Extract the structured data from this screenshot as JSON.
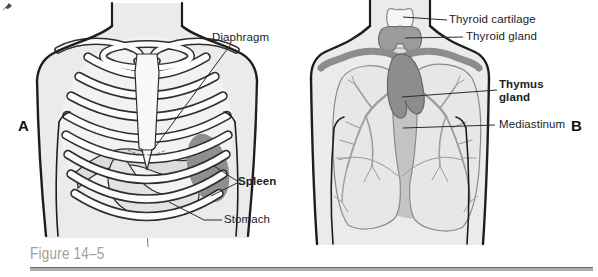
{
  "figure": {
    "caption": "Figure 14–5",
    "panel_a": {
      "letter": "A",
      "labels": {
        "diaphragm": "Diaphragm",
        "spleen": "Spleen",
        "stomach": "Stomach"
      }
    },
    "panel_b": {
      "letter": "B",
      "labels": {
        "thyroid_cartilage": "Thyroid cartilage",
        "thyroid_gland": "Thyroid gland",
        "thymus_gland": "Thymus gland",
        "mediastinum": "Mediastinum"
      }
    },
    "colors": {
      "skin": "#ebebeb",
      "outline": "#2a2a2a",
      "bone_white": "#fcfcfc",
      "organ_light": "#dedede",
      "organ_mid": "#c4c4c4",
      "organ_dark": "#8d8d8d",
      "caption_gray": "#9e9e9e",
      "rule_gray": "#adadad"
    }
  }
}
